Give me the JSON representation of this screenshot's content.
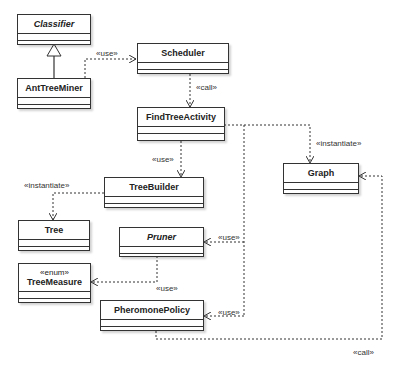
{
  "classes": {
    "classifier": {
      "name": "Classifier",
      "abstract": true
    },
    "ant_tree_miner": {
      "name": "AntTreeMiner"
    },
    "scheduler": {
      "name": "Scheduler"
    },
    "find_tree_activity": {
      "name": "FindTreeActivity"
    },
    "graph": {
      "name": "Graph"
    },
    "tree_builder": {
      "name": "TreeBuilder"
    },
    "tree": {
      "name": "Tree"
    },
    "pruner": {
      "name": "Pruner",
      "abstract": true
    },
    "tree_measure": {
      "name": "TreeMeasure",
      "stereotype": "«enum»"
    },
    "pheromone_policy": {
      "name": "PheromonePolicy"
    }
  },
  "relations": [
    {
      "from": "AntTreeMiner",
      "to": "Classifier",
      "type": "generalization",
      "label": ""
    },
    {
      "from": "AntTreeMiner",
      "to": "Scheduler",
      "type": "dependency",
      "label": "«use»"
    },
    {
      "from": "Scheduler",
      "to": "FindTreeActivity",
      "type": "dependency",
      "label": "«call»"
    },
    {
      "from": "FindTreeActivity",
      "to": "Graph",
      "type": "dependency",
      "label": "«instantiate»"
    },
    {
      "from": "FindTreeActivity",
      "to": "TreeBuilder",
      "type": "dependency",
      "label": "«use»"
    },
    {
      "from": "TreeBuilder",
      "to": "Tree",
      "type": "dependency",
      "label": "«instantiate»"
    },
    {
      "from": "FindTreeActivity",
      "to": "Pruner",
      "type": "dependency",
      "label": "«use»"
    },
    {
      "from": "Pruner",
      "to": "TreeMeasure",
      "type": "dependency",
      "label": "«use»"
    },
    {
      "from": "FindTreeActivity",
      "to": "PheromonePolicy",
      "type": "dependency",
      "label": "«use»"
    },
    {
      "from": "PheromonePolicy",
      "to": "Graph",
      "type": "dependency",
      "label": "«call»"
    }
  ],
  "labels": {
    "use_ant_scheduler": "«use»",
    "call_scheduler_find": "«call»",
    "instantiate_graph": "«instantiate»",
    "use_treebuilder": "«use»",
    "instantiate_tree": "«instantiate»",
    "use_pruner": "«use»",
    "use_treemeasure": "«use»",
    "use_pheromone": "«use»",
    "call_graph": "«call»"
  }
}
